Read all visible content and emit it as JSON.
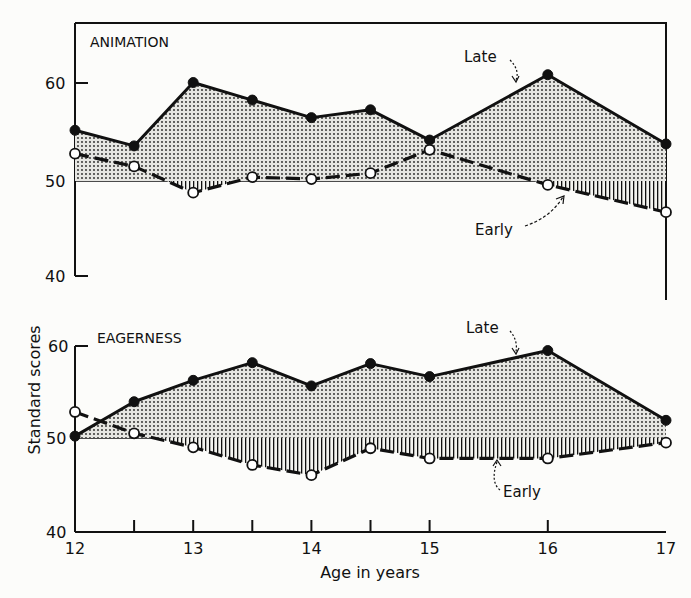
{
  "chart_data": [
    {
      "type": "line",
      "title": "ANIMATION",
      "xlabel": "Age in years",
      "ylabel": "Standard scores",
      "x": [
        12,
        12.5,
        13,
        13.5,
        14,
        14.5,
        15,
        16,
        17
      ],
      "ylim": [
        40,
        65
      ],
      "yticks": [
        40,
        50,
        60
      ],
      "baseline": 50,
      "series": [
        {
          "name": "Late",
          "style": "solid, filled dots",
          "values": [
            55.2,
            53.6,
            60.1,
            58.3,
            56.5,
            57.3,
            54.2,
            60.9,
            53.8
          ]
        },
        {
          "name": "Early",
          "style": "dashed, open circles",
          "values": [
            52.8,
            51.5,
            48.8,
            50.4,
            50.2,
            50.8,
            53.2,
            49.6,
            46.8
          ]
        }
      ],
      "annotations": [
        "Late",
        "Early"
      ]
    },
    {
      "type": "line",
      "title": "EAGERNESS",
      "xlabel": "Age in years",
      "ylabel": "Standard scores",
      "x": [
        12,
        12.5,
        13,
        13.5,
        14,
        14.5,
        15,
        16,
        17
      ],
      "ylim": [
        40,
        62
      ],
      "yticks": [
        40,
        50,
        60
      ],
      "baseline": 50,
      "series": [
        {
          "name": "Late",
          "style": "solid, filled dots",
          "values": [
            50.2,
            53.9,
            56.2,
            58.1,
            55.6,
            58.0,
            56.6,
            59.4,
            51.9
          ]
        },
        {
          "name": "Early",
          "style": "dashed, open circles",
          "values": [
            52.8,
            50.5,
            49.0,
            47.1,
            46.0,
            48.9,
            47.8,
            47.8,
            49.5
          ]
        }
      ],
      "annotations": [
        "Late",
        "Early"
      ]
    }
  ],
  "labels": {
    "top_title": "ANIMATION",
    "bottom_title": "EAGERNESS",
    "ylabel": "Standard scores",
    "xlabel": "Age in years",
    "late": "Late",
    "early": "Early",
    "yticks": [
      "60",
      "50",
      "40"
    ],
    "xticks": [
      "12",
      "13",
      "14",
      "15",
      "16",
      "17"
    ]
  }
}
